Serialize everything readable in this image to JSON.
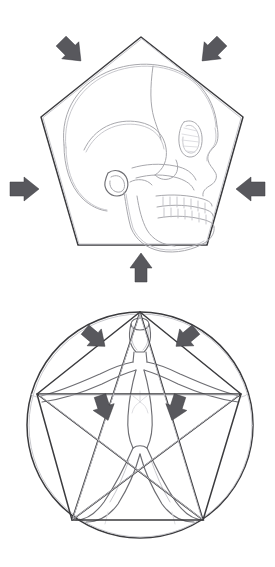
{
  "document": {
    "title": "Pentagonal Proportion Studies",
    "medium": "pencil sketch",
    "background_color": "#ffffff",
    "width": 275,
    "height": 567,
    "figure_count": 2
  },
  "palette": {
    "paper": "#ffffff",
    "graphite_hard": "#3b3b3e",
    "graphite_mid": "#6e6e73",
    "graphite_soft": "#a8a8ad",
    "graphite_faint": "#c2c2c7",
    "arrow_fill": "#58585d",
    "arrow_stroke": "#3a3a3e"
  },
  "figures": [
    {
      "id": "skull-pentagon",
      "name": "Skull inscribed in pentagon",
      "caption": "",
      "subject": "human skull, lateral (profile) view facing right",
      "container_shape": "pentagon",
      "container": {
        "type": "regular-pentagon",
        "center": [
          141,
          148
        ],
        "circumradius": 112,
        "apex": [
          141,
          37
        ],
        "vertices": [
          [
            141,
            37
          ],
          [
            243,
            117
          ],
          [
            207,
            245
          ],
          [
            78,
            245
          ],
          [
            41,
            117
          ]
        ],
        "stroke": "#3b3b3e"
      },
      "arrows": [
        {
          "name": "arrow-top-left",
          "at": [
            71,
            57
          ],
          "angle_deg": 45,
          "direction": "down-right",
          "points_toward": "upper-left edge"
        },
        {
          "name": "arrow-top-right",
          "at": [
            213,
            57
          ],
          "angle_deg": 135,
          "direction": "down-left",
          "points_toward": "upper-right edge"
        },
        {
          "name": "arrow-left",
          "at": [
            24,
            188
          ],
          "angle_deg": 0,
          "direction": "right",
          "points_toward": "left edge"
        },
        {
          "name": "arrow-right",
          "at": [
            251,
            188
          ],
          "angle_deg": 180,
          "direction": "left",
          "points_toward": "right edge"
        },
        {
          "name": "arrow-bottom",
          "at": [
            141,
            270
          ],
          "angle_deg": 270,
          "direction": "up",
          "points_toward": "bottom edge"
        }
      ],
      "arrow_count": 5,
      "anatomy_labels": [
        "cranial vault",
        "coronal suture",
        "temporal line",
        "orbit",
        "nasal aperture",
        "zygomatic arch",
        "external auditory meatus",
        "maxilla with teeth",
        "mandible",
        "ramus of mandible"
      ]
    },
    {
      "id": "pentagram-man",
      "name": "Human figure inscribed in pentagram and circle",
      "caption": "",
      "subject": "standing human figure, arms outstretched, legs apart",
      "container_shape": "pentagram in circle",
      "container": {
        "type": "pentagram-in-circle",
        "center": [
          140,
          425
        ],
        "circle_radius": 113,
        "vertices": [
          [
            140,
            312
          ],
          [
            241,
            394
          ],
          [
            203,
            520
          ],
          [
            72,
            520
          ],
          [
            37,
            394
          ]
        ],
        "star_edges": [
          [
            0,
            2
          ],
          [
            2,
            4
          ],
          [
            4,
            1
          ],
          [
            1,
            3
          ],
          [
            3,
            0
          ]
        ],
        "outline_edges": [
          [
            0,
            1
          ],
          [
            1,
            2
          ],
          [
            2,
            3
          ],
          [
            3,
            4
          ],
          [
            4,
            0
          ]
        ],
        "stroke": "#3b3b3e"
      },
      "arrows": [
        {
          "name": "arrow-upper-left",
          "at": [
            95,
            338
          ],
          "angle_deg": 40,
          "direction": "down-right",
          "points_toward": "left arm / upper-left limb"
        },
        {
          "name": "arrow-upper-right",
          "at": [
            186,
            338
          ],
          "angle_deg": 140,
          "direction": "down-left",
          "points_toward": "right arm / upper-right limb"
        },
        {
          "name": "arrow-lower-left",
          "at": [
            97,
            414
          ],
          "angle_deg": 72,
          "direction": "down",
          "points_toward": "left leg"
        },
        {
          "name": "arrow-lower-right",
          "at": [
            182,
            414
          ],
          "angle_deg": 108,
          "direction": "down",
          "points_toward": "right leg"
        }
      ],
      "arrow_count": 4,
      "anatomy_labels": [
        "head",
        "neck",
        "shoulders",
        "outstretched arms",
        "torso",
        "sternum / ribcage marking",
        "hips",
        "splayed legs",
        "feet at lower star points"
      ]
    }
  ]
}
